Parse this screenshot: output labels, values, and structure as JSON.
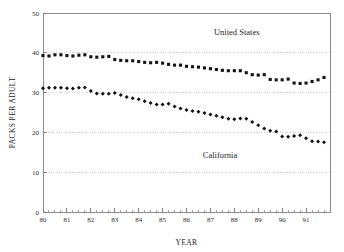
{
  "chart_data": {
    "type": "line",
    "title": "",
    "xlabel": "YEAR",
    "ylabel": "PACKS PER ADULT",
    "xlim": [
      1980.0,
      1992.0
    ],
    "ylim": [
      0,
      50
    ],
    "grid": true,
    "grid_values": [
      10,
      20,
      30,
      40
    ],
    "legend_position": "inline-annotation",
    "y_ticks": [
      0,
      10,
      20,
      30,
      40,
      50
    ],
    "y_tick_labels": [
      "0",
      "10",
      "20",
      "30",
      "40",
      "50"
    ],
    "x_ticks": [
      1980,
      1981,
      1982,
      1983,
      1984,
      1985,
      1986,
      1987,
      1988,
      1989,
      1990,
      1991
    ],
    "x_tick_labels": [
      "80",
      "81",
      "82",
      "83",
      "84",
      "85",
      "86",
      "87",
      "88",
      "89",
      "90",
      "91"
    ],
    "x_minor_tick_interval": 0.25,
    "x": [
      1980.0,
      1980.25,
      1980.5,
      1980.75,
      1981.0,
      1981.25,
      1981.5,
      1981.75,
      1982.0,
      1982.25,
      1982.5,
      1982.75,
      1983.0,
      1983.25,
      1983.5,
      1983.75,
      1984.0,
      1984.25,
      1984.5,
      1984.75,
      1985.0,
      1985.25,
      1985.5,
      1985.75,
      1986.0,
      1986.25,
      1986.5,
      1986.75,
      1987.0,
      1987.25,
      1987.5,
      1987.75,
      1988.0,
      1988.25,
      1988.5,
      1988.75,
      1989.0,
      1989.25,
      1989.5,
      1989.75,
      1990.0,
      1990.25,
      1990.5,
      1990.75,
      1991.0,
      1991.25,
      1991.5,
      1991.75
    ],
    "series": [
      {
        "name": "United States",
        "marker": "square",
        "color": "#141414",
        "values": [
          39.3,
          39.2,
          39.5,
          39.5,
          39.3,
          39.2,
          39.4,
          39.5,
          39.0,
          38.9,
          39.0,
          39.1,
          38.3,
          38.1,
          38.0,
          38.0,
          37.8,
          37.6,
          37.5,
          37.6,
          37.4,
          37.1,
          36.9,
          36.9,
          36.6,
          36.5,
          36.4,
          36.2,
          36.0,
          35.8,
          35.6,
          35.5,
          35.5,
          35.5,
          35.0,
          34.5,
          34.4,
          34.5,
          33.3,
          33.2,
          33.2,
          33.4,
          32.4,
          32.3,
          32.4,
          32.8,
          33.2,
          33.8
        ]
      },
      {
        "name": "California",
        "marker": "diamond",
        "color": "#141414",
        "values": [
          31.1,
          31.2,
          31.2,
          31.2,
          31.1,
          31.0,
          31.2,
          31.3,
          30.4,
          29.8,
          29.7,
          29.7,
          29.9,
          29.4,
          28.9,
          28.6,
          28.3,
          27.8,
          27.4,
          27.0,
          27.0,
          27.2,
          26.5,
          26.0,
          25.6,
          25.4,
          25.2,
          24.9,
          24.5,
          24.2,
          23.8,
          23.4,
          23.3,
          23.5,
          23.4,
          22.6,
          21.8,
          21.0,
          20.4,
          20.2,
          19.0,
          18.9,
          19.1,
          19.3,
          18.5,
          17.8,
          17.7,
          17.5
        ]
      }
    ],
    "annotations": [
      {
        "text": "United States",
        "x": 1988.1,
        "y": 44.5
      },
      {
        "text": "California",
        "x": 1987.4,
        "y": 13.6
      }
    ]
  },
  "figure": {
    "background": "#ffffff",
    "axis_color": "#8c8c8c",
    "grid_color": "#b9b9b9",
    "text_color": "#1a1a1a"
  }
}
